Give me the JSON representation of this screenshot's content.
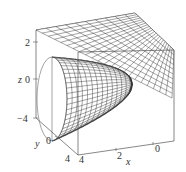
{
  "chart_data": {
    "type": "surface3d",
    "title": "",
    "surfaces": [
      {
        "name": "paraboloid",
        "description": "elliptic paraboloid opening along the y-axis (wireframe mesh)",
        "mesh_color": "#222222"
      },
      {
        "name": "plane",
        "description": "tilted plane cutting through the top of the box (wireframe mesh)",
        "mesh_color": "#222222"
      }
    ],
    "axes": {
      "x": {
        "label": "x",
        "ticks": [
          "4",
          "2",
          "0"
        ],
        "range": [
          0,
          4
        ]
      },
      "y": {
        "label": "y",
        "ticks": [
          "4",
          "0"
        ],
        "range": [
          -4,
          4
        ]
      },
      "z": {
        "label": "z",
        "ticks": [
          "2",
          "0",
          "−4"
        ],
        "range": [
          -4,
          2
        ]
      }
    },
    "grid": false,
    "box": true,
    "legend": "none"
  }
}
